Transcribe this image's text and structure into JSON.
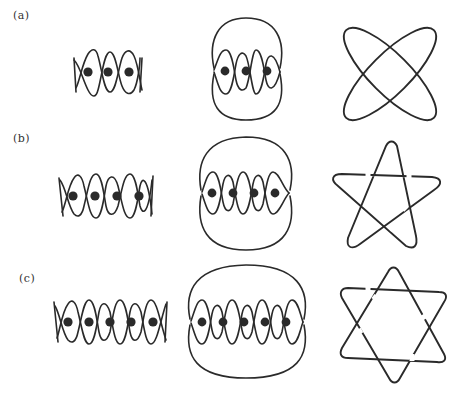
{
  "figure": {
    "rows": [
      {
        "label": "(a)",
        "strands": 3,
        "panels": {
          "braid": "closed 2-string braid with 3 punctures (dots)",
          "closure": "braid closure with outer loop",
          "knot": "two interlinked ellipses (4 crossings)"
        }
      },
      {
        "label": "(b)",
        "strands": 4,
        "panels": {
          "braid": "closed 2-string braid with 4 punctures (dots)",
          "closure": "braid closure with outer loop",
          "knot": "pentagram torus knot"
        }
      },
      {
        "label": "(c)",
        "strands": 5,
        "panels": {
          "braid": "closed 2-string braid with 5 punctures (dots)",
          "closure": "braid closure with outer loop",
          "knot": "hexagram (star of David) link"
        }
      }
    ],
    "colors": {
      "ink": "#2a2a2a",
      "background": "#ffffff"
    }
  }
}
